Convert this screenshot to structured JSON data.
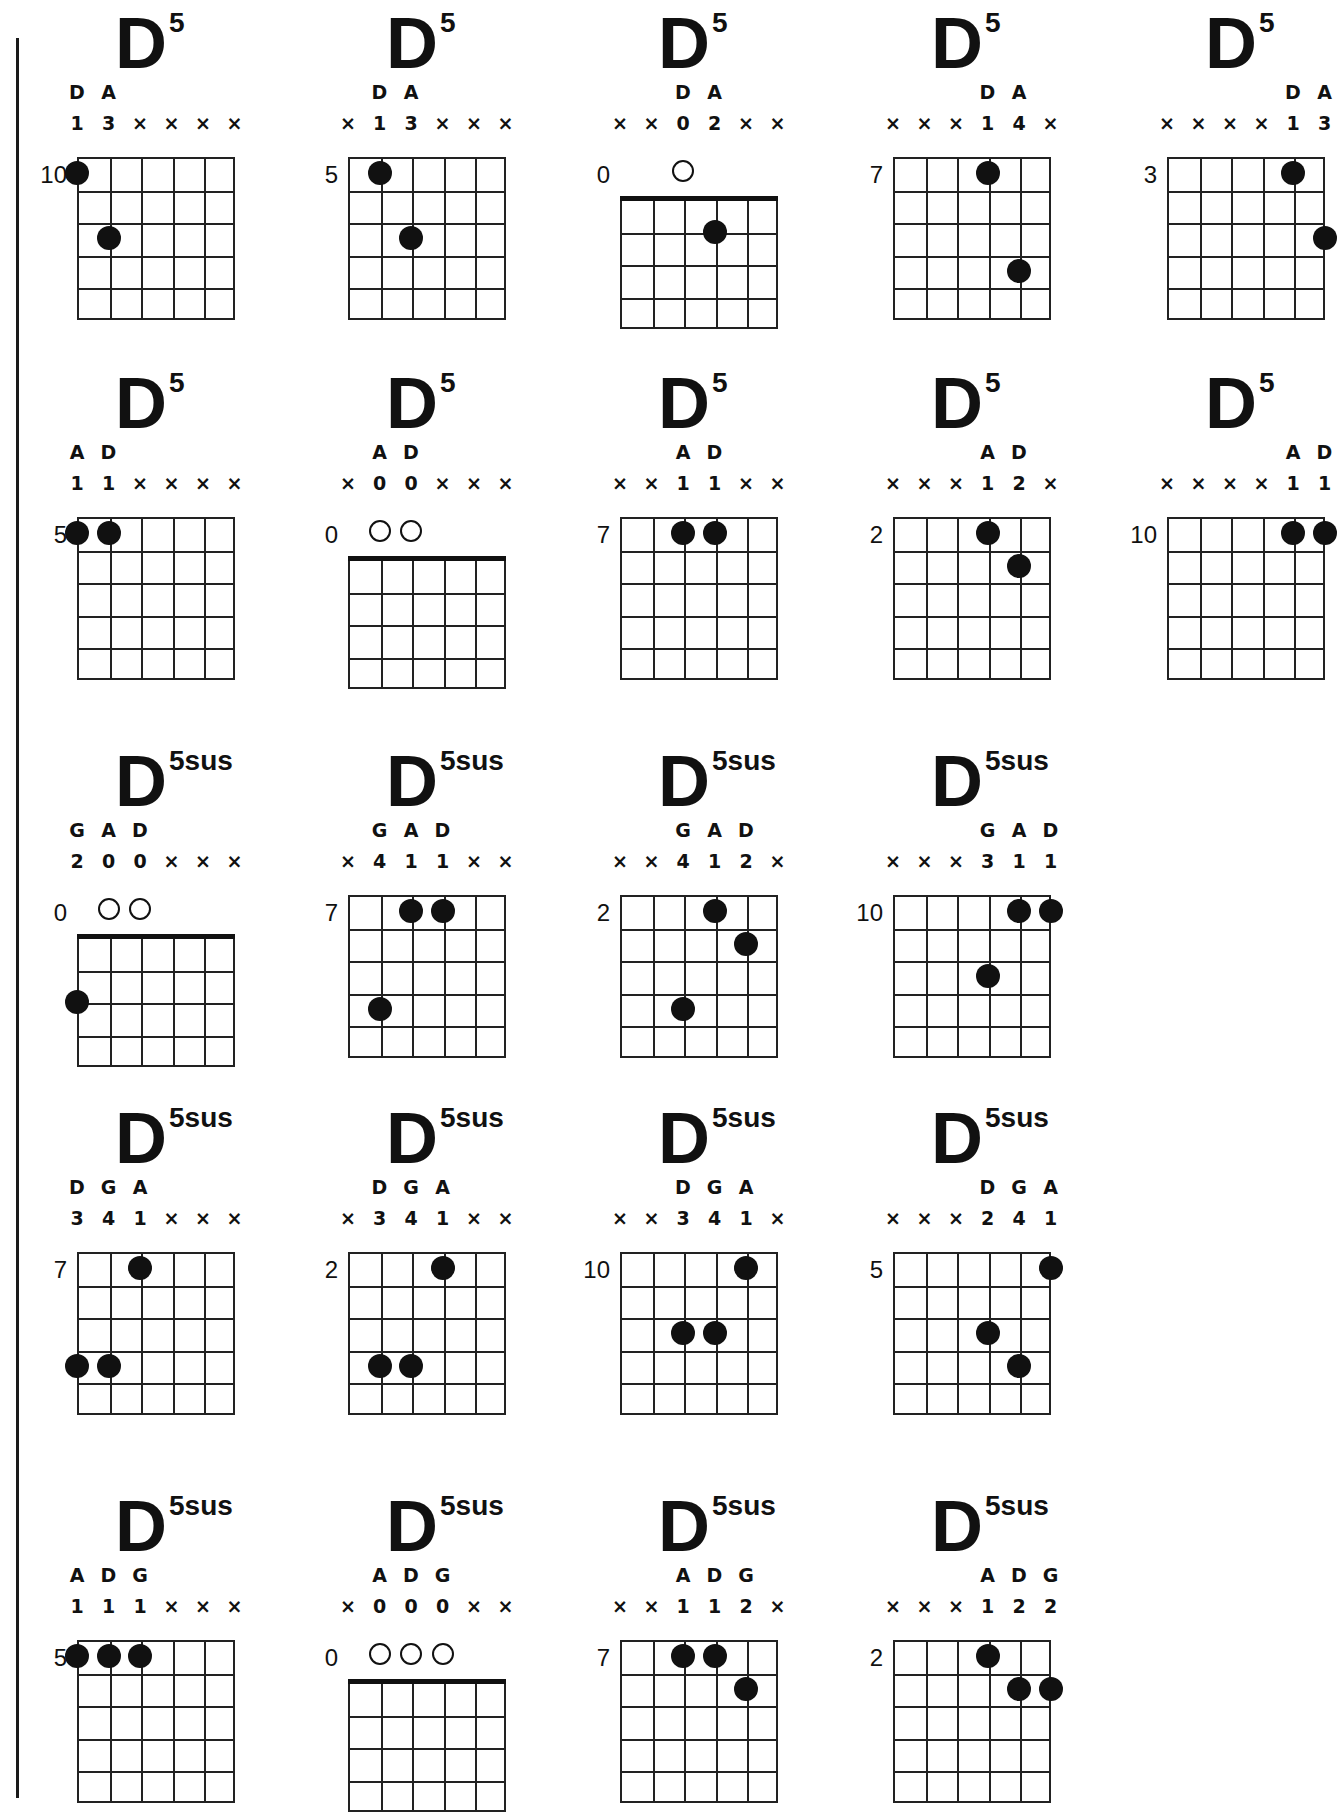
{
  "page": {
    "chord_name_root": "D",
    "grid_cols": 6,
    "ink_color": "#111111",
    "background": "#ffffff"
  },
  "chords": [
    {
      "root": "D",
      "sup": "5",
      "col": 0,
      "row": 0,
      "fret": "10",
      "open_pos": false,
      "notes": [
        [
          "D",
          0
        ],
        [
          "A",
          1
        ]
      ],
      "marks": [
        "1",
        "3",
        "×",
        "×",
        "×",
        "×"
      ],
      "dots": [
        [
          0,
          1
        ],
        [
          1,
          3
        ]
      ],
      "opens": []
    },
    {
      "root": "D",
      "sup": "5",
      "col": 1,
      "row": 0,
      "fret": "5",
      "open_pos": false,
      "notes": [
        [
          "D",
          1
        ],
        [
          "A",
          2
        ]
      ],
      "marks": [
        "×",
        "1",
        "3",
        "×",
        "×",
        "×"
      ],
      "dots": [
        [
          1,
          1
        ],
        [
          2,
          3
        ]
      ],
      "opens": []
    },
    {
      "root": "D",
      "sup": "5",
      "col": 2,
      "row": 0,
      "fret": "0",
      "open_pos": true,
      "notes": [
        [
          "D",
          2
        ],
        [
          "A",
          3
        ]
      ],
      "marks": [
        "×",
        "×",
        "0",
        "2",
        "×",
        "×"
      ],
      "dots": [
        [
          3,
          2
        ]
      ],
      "opens": [
        2
      ]
    },
    {
      "root": "D",
      "sup": "5",
      "col": 3,
      "row": 0,
      "fret": "7",
      "open_pos": false,
      "notes": [
        [
          "D",
          3
        ],
        [
          "A",
          4
        ]
      ],
      "marks": [
        "×",
        "×",
        "×",
        "1",
        "4",
        "×"
      ],
      "dots": [
        [
          3,
          1
        ],
        [
          4,
          4
        ]
      ],
      "opens": []
    },
    {
      "root": "D",
      "sup": "5",
      "col": 4,
      "row": 0,
      "fret": "3",
      "open_pos": false,
      "notes": [
        [
          "D",
          4
        ],
        [
          "A",
          5
        ]
      ],
      "marks": [
        "×",
        "×",
        "×",
        "×",
        "1",
        "3"
      ],
      "dots": [
        [
          4,
          1
        ],
        [
          5,
          3
        ]
      ],
      "opens": []
    },
    {
      "root": "D",
      "sup": "5",
      "col": 0,
      "row": 1,
      "fret": "5",
      "open_pos": false,
      "notes": [
        [
          "A",
          0
        ],
        [
          "D",
          1
        ]
      ],
      "marks": [
        "1",
        "1",
        "×",
        "×",
        "×",
        "×"
      ],
      "dots": [
        [
          0,
          1
        ],
        [
          1,
          1
        ]
      ],
      "opens": []
    },
    {
      "root": "D",
      "sup": "5",
      "col": 1,
      "row": 1,
      "fret": "0",
      "open_pos": true,
      "notes": [
        [
          "A",
          1
        ],
        [
          "D",
          2
        ]
      ],
      "marks": [
        "×",
        "0",
        "0",
        "×",
        "×",
        "×"
      ],
      "dots": [],
      "opens": [
        1,
        2
      ]
    },
    {
      "root": "D",
      "sup": "5",
      "col": 2,
      "row": 1,
      "fret": "7",
      "open_pos": false,
      "notes": [
        [
          "A",
          2
        ],
        [
          "D",
          3
        ]
      ],
      "marks": [
        "×",
        "×",
        "1",
        "1",
        "×",
        "×"
      ],
      "dots": [
        [
          2,
          1
        ],
        [
          3,
          1
        ]
      ],
      "opens": []
    },
    {
      "root": "D",
      "sup": "5",
      "col": 3,
      "row": 1,
      "fret": "2",
      "open_pos": false,
      "notes": [
        [
          "A",
          3
        ],
        [
          "D",
          4
        ]
      ],
      "marks": [
        "×",
        "×",
        "×",
        "1",
        "2",
        "×"
      ],
      "dots": [
        [
          3,
          1
        ],
        [
          4,
          2
        ]
      ],
      "opens": []
    },
    {
      "root": "D",
      "sup": "5",
      "col": 4,
      "row": 1,
      "fret": "10",
      "open_pos": false,
      "notes": [
        [
          "A",
          4
        ],
        [
          "D",
          5
        ]
      ],
      "marks": [
        "×",
        "×",
        "×",
        "×",
        "1",
        "1"
      ],
      "dots": [
        [
          4,
          1
        ],
        [
          5,
          1
        ]
      ],
      "opens": []
    },
    {
      "root": "D",
      "sup": "5sus",
      "col": 0,
      "row": 2,
      "fret": "0",
      "open_pos": true,
      "notes": [
        [
          "G",
          0
        ],
        [
          "A",
          1
        ],
        [
          "D",
          2
        ]
      ],
      "marks": [
        "2",
        "0",
        "0",
        "×",
        "×",
        "×"
      ],
      "dots": [
        [
          0,
          3
        ]
      ],
      "opens": [
        1,
        2
      ]
    },
    {
      "root": "D",
      "sup": "5sus",
      "col": 1,
      "row": 2,
      "fret": "7",
      "open_pos": false,
      "notes": [
        [
          "G",
          1
        ],
        [
          "A",
          2
        ],
        [
          "D",
          3
        ]
      ],
      "marks": [
        "×",
        "4",
        "1",
        "1",
        "×",
        "×"
      ],
      "dots": [
        [
          2,
          1
        ],
        [
          3,
          1
        ],
        [
          1,
          4
        ]
      ],
      "opens": []
    },
    {
      "root": "D",
      "sup": "5sus",
      "col": 2,
      "row": 2,
      "fret": "2",
      "open_pos": false,
      "notes": [
        [
          "G",
          2
        ],
        [
          "A",
          3
        ],
        [
          "D",
          4
        ]
      ],
      "marks": [
        "×",
        "×",
        "4",
        "1",
        "2",
        "×"
      ],
      "dots": [
        [
          3,
          1
        ],
        [
          4,
          2
        ],
        [
          2,
          4
        ]
      ],
      "opens": []
    },
    {
      "root": "D",
      "sup": "5sus",
      "col": 3,
      "row": 2,
      "fret": "10",
      "open_pos": false,
      "notes": [
        [
          "G",
          3
        ],
        [
          "A",
          4
        ],
        [
          "D",
          5
        ]
      ],
      "marks": [
        "×",
        "×",
        "×",
        "3",
        "1",
        "1"
      ],
      "dots": [
        [
          4,
          1
        ],
        [
          5,
          1
        ],
        [
          3,
          3
        ]
      ],
      "opens": []
    },
    {
      "root": "D",
      "sup": "5sus",
      "col": 0,
      "row": 3,
      "fret": "7",
      "open_pos": false,
      "notes": [
        [
          "D",
          0
        ],
        [
          "G",
          1
        ],
        [
          "A",
          2
        ]
      ],
      "marks": [
        "3",
        "4",
        "1",
        "×",
        "×",
        "×"
      ],
      "dots": [
        [
          2,
          1
        ],
        [
          0,
          4
        ],
        [
          1,
          4
        ]
      ],
      "opens": []
    },
    {
      "root": "D",
      "sup": "5sus",
      "col": 1,
      "row": 3,
      "fret": "2",
      "open_pos": false,
      "notes": [
        [
          "D",
          1
        ],
        [
          "G",
          2
        ],
        [
          "A",
          3
        ]
      ],
      "marks": [
        "×",
        "3",
        "4",
        "1",
        "×",
        "×"
      ],
      "dots": [
        [
          3,
          1
        ],
        [
          1,
          4
        ],
        [
          2,
          4
        ]
      ],
      "opens": []
    },
    {
      "root": "D",
      "sup": "5sus",
      "col": 2,
      "row": 3,
      "fret": "10",
      "open_pos": false,
      "notes": [
        [
          "D",
          2
        ],
        [
          "G",
          3
        ],
        [
          "A",
          4
        ]
      ],
      "marks": [
        "×",
        "×",
        "3",
        "4",
        "1",
        "×"
      ],
      "dots": [
        [
          4,
          1
        ],
        [
          2,
          3
        ],
        [
          3,
          3
        ]
      ],
      "opens": []
    },
    {
      "root": "D",
      "sup": "5sus",
      "col": 3,
      "row": 3,
      "fret": "5",
      "open_pos": false,
      "notes": [
        [
          "D",
          3
        ],
        [
          "G",
          4
        ],
        [
          "A",
          5
        ]
      ],
      "marks": [
        "×",
        "×",
        "×",
        "2",
        "4",
        "1"
      ],
      "dots": [
        [
          5,
          1
        ],
        [
          3,
          3
        ],
        [
          4,
          4
        ]
      ],
      "opens": []
    },
    {
      "root": "D",
      "sup": "5sus",
      "col": 0,
      "row": 4,
      "fret": "5",
      "open_pos": false,
      "notes": [
        [
          "A",
          0
        ],
        [
          "D",
          1
        ],
        [
          "G",
          2
        ]
      ],
      "marks": [
        "1",
        "1",
        "1",
        "×",
        "×",
        "×"
      ],
      "dots": [
        [
          0,
          1
        ],
        [
          1,
          1
        ],
        [
          2,
          1
        ]
      ],
      "opens": []
    },
    {
      "root": "D",
      "sup": "5sus",
      "col": 1,
      "row": 4,
      "fret": "0",
      "open_pos": true,
      "notes": [
        [
          "A",
          1
        ],
        [
          "D",
          2
        ],
        [
          "G",
          3
        ]
      ],
      "marks": [
        "×",
        "0",
        "0",
        "0",
        "×",
        "×"
      ],
      "dots": [],
      "opens": [
        1,
        2,
        3
      ]
    },
    {
      "root": "D",
      "sup": "5sus",
      "col": 2,
      "row": 4,
      "fret": "7",
      "open_pos": false,
      "notes": [
        [
          "A",
          2
        ],
        [
          "D",
          3
        ],
        [
          "G",
          4
        ]
      ],
      "marks": [
        "×",
        "×",
        "1",
        "1",
        "2",
        "×"
      ],
      "dots": [
        [
          2,
          1
        ],
        [
          3,
          1
        ],
        [
          4,
          2
        ]
      ],
      "opens": []
    },
    {
      "root": "D",
      "sup": "5sus",
      "col": 3,
      "row": 4,
      "fret": "2",
      "open_pos": false,
      "notes": [
        [
          "A",
          3
        ],
        [
          "D",
          4
        ],
        [
          "G",
          5
        ]
      ],
      "marks": [
        "×",
        "×",
        "×",
        "1",
        "2",
        "2"
      ],
      "dots": [
        [
          3,
          1
        ],
        [
          4,
          2
        ],
        [
          5,
          2
        ]
      ],
      "opens": []
    }
  ]
}
